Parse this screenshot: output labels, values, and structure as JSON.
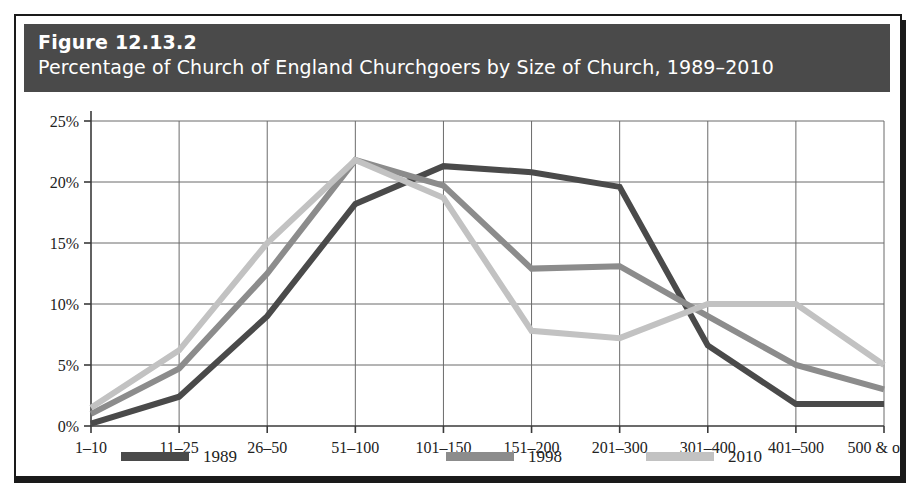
{
  "figure": {
    "number": "Figure 12.13.2",
    "subtitle": "Percentage of Church of England Churchgoers by Size of Church, 1989–2010"
  },
  "colors": {
    "title_bar_bg": "#4a4a4a",
    "title_text": "#ffffff",
    "border": "#1a1a1a",
    "plot_bg": "#ffffff",
    "grid": "#6b6b6b",
    "axis": "#3a3a3a",
    "series_1989": "#4a4a4a",
    "series_1998": "#8c8c8c",
    "series_2010": "#c2c2c2"
  },
  "chart_data": {
    "type": "line",
    "title": "Percentage of Church of England Churchgoers by Size of Church, 1989–2010",
    "xlabel": "",
    "ylabel": "",
    "ylim": [
      0,
      25
    ],
    "yticks": [
      0,
      5,
      10,
      15,
      20,
      25
    ],
    "ytick_labels": [
      "0%",
      "5%",
      "10%",
      "15%",
      "20%",
      "25%"
    ],
    "grid": true,
    "legend_position": "bottom",
    "categories": [
      "1–10",
      "11–25",
      "26–50",
      "51–100",
      "101–150",
      "151–200",
      "201–300",
      "301–400",
      "401–500",
      "500 & over"
    ],
    "series": [
      {
        "name": "1989",
        "color": "#4a4a4a",
        "values": [
          0.2,
          2.4,
          9.0,
          18.2,
          21.3,
          20.8,
          19.6,
          6.6,
          1.8,
          1.8
        ]
      },
      {
        "name": "1998",
        "color": "#8c8c8c",
        "values": [
          1.0,
          4.7,
          12.5,
          21.8,
          19.7,
          12.9,
          13.1,
          9.0,
          5.0,
          3.0
        ]
      },
      {
        "name": "2010",
        "color": "#c2c2c2",
        "values": [
          1.5,
          6.2,
          15.0,
          21.8,
          18.7,
          7.8,
          7.2,
          10.0,
          10.0,
          5.0
        ]
      }
    ]
  }
}
